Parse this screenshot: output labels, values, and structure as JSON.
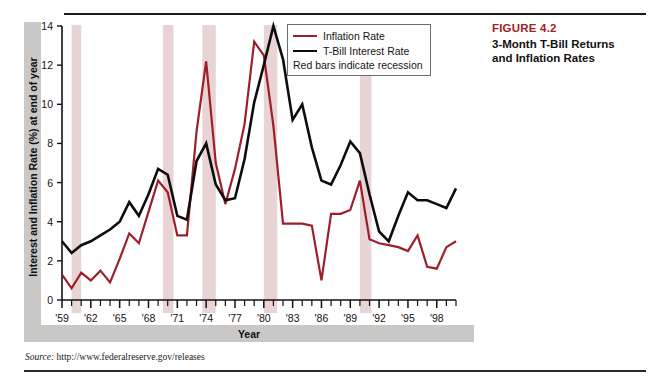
{
  "caption": {
    "figure_number": "FIGURE 4.2",
    "figure_title": "3-Month T-Bill Returns and Inflation Rates"
  },
  "axes": {
    "ylabel": "Interest and Inflation Rate (%) at end of year",
    "xlabel": "Year",
    "ytick_labels": [
      "0",
      "2",
      "4",
      "6",
      "8",
      "10",
      "12",
      "14"
    ],
    "xtick_labels": [
      "'59",
      "'62",
      "'65",
      "'68",
      "'71",
      "'74",
      "'77",
      "'80",
      "'83",
      "'86",
      "'89",
      "'92",
      "'95",
      "'98"
    ]
  },
  "legend": {
    "inflation_label": "Inflation Rate",
    "tbill_label": "T-Bill Interest Rate",
    "recession_note": "Red bars indicate recession"
  },
  "source": {
    "label": "Source:",
    "url": "http://www.federalreserve.gov/releases"
  },
  "colors": {
    "inflation_line": "#9e1f2a",
    "tbill_line": "#0d0d0d",
    "recession_band": "#e8d3d5",
    "figure_number": "#a32125",
    "frame_grey": "#c9c8c6"
  },
  "chart_data": {
    "type": "line",
    "title": "3-Month T-Bill Returns and Inflation Rates",
    "xlabel": "Year",
    "ylabel": "Interest and Inflation Rate (%) at end of year",
    "xlim": [
      1959,
      2000
    ],
    "ylim": [
      0,
      14
    ],
    "yticks": [
      0,
      2,
      4,
      6,
      8,
      10,
      12,
      14
    ],
    "xticks": [
      1959,
      1962,
      1965,
      1968,
      1971,
      1974,
      1977,
      1980,
      1983,
      1986,
      1989,
      1992,
      1995,
      1998
    ],
    "grid": false,
    "legend_position": "top-right",
    "x": [
      1959,
      1960,
      1961,
      1962,
      1963,
      1964,
      1965,
      1966,
      1967,
      1968,
      1969,
      1970,
      1971,
      1972,
      1973,
      1974,
      1975,
      1976,
      1977,
      1978,
      1979,
      1980,
      1981,
      1982,
      1983,
      1984,
      1985,
      1986,
      1987,
      1988,
      1989,
      1990,
      1991,
      1992,
      1993,
      1994,
      1995,
      1996,
      1997,
      1998,
      1999,
      2000
    ],
    "series": [
      {
        "name": "Inflation Rate",
        "color": "#9e1f2a",
        "values": [
          1.3,
          0.6,
          1.4,
          1.0,
          1.5,
          0.9,
          2.1,
          3.4,
          2.9,
          4.5,
          6.1,
          5.5,
          3.3,
          3.3,
          8.6,
          12.2,
          7.0,
          4.9,
          6.7,
          9.0,
          13.2,
          12.5,
          8.9,
          3.9,
          3.9,
          3.9,
          3.8,
          1.0,
          4.4,
          4.4,
          4.6,
          6.1,
          3.1,
          2.9,
          2.8,
          2.7,
          2.5,
          3.3,
          1.7,
          1.6,
          2.7,
          3.0
        ]
      },
      {
        "name": "T-Bill Interest Rate",
        "color": "#0d0d0d",
        "values": [
          3.0,
          2.4,
          2.8,
          3.0,
          3.3,
          3.6,
          4.0,
          5.0,
          4.3,
          5.4,
          6.7,
          6.4,
          4.3,
          4.1,
          7.1,
          8.0,
          5.9,
          5.1,
          5.2,
          7.2,
          10.1,
          12.0,
          14.0,
          12.3,
          9.2,
          10.0,
          7.8,
          6.1,
          5.9,
          6.9,
          8.1,
          7.5,
          5.4,
          3.5,
          3.0,
          4.3,
          5.5,
          5.1,
          5.1,
          4.9,
          4.7,
          5.7
        ]
      }
    ],
    "recession_bands": [
      {
        "start": 1960.0,
        "end": 1961.0
      },
      {
        "start": 1969.5,
        "end": 1970.6
      },
      {
        "start": 1973.6,
        "end": 1975.0
      },
      {
        "start": 1980.0,
        "end": 1981.4
      },
      {
        "start": 1990.0,
        "end": 1991.2
      }
    ]
  }
}
